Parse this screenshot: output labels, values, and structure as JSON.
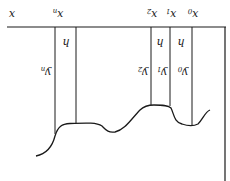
{
  "figure": {
    "orientation": "rotated 180 degrees (upside down)",
    "line_color": "#1a1a1a",
    "background": "#ffffff",
    "axis_label": "x",
    "nodes": [
      {
        "label": "x",
        "sub": "0",
        "y_label": "y",
        "y_sub": "0"
      },
      {
        "label": "x",
        "sub": "1",
        "y_label": "y",
        "y_sub": "1"
      },
      {
        "label": "x",
        "sub": "2",
        "y_label": "y",
        "y_sub": "2"
      },
      {
        "label": "x",
        "sub": "n",
        "y_label": "y",
        "y_sub": "n"
      }
    ],
    "step_label": "h"
  }
}
